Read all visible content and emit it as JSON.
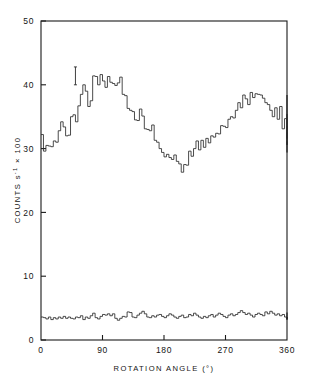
{
  "chart_data": {
    "type": "line",
    "subtype": "step-histogram",
    "title": "",
    "xlabel": "ROTATION ANGLE (°)",
    "ylabel": "COUNTS s⁻¹ × 100",
    "ylabel_parts": {
      "main": "COUNTS s",
      "exponent": "-1",
      "tail": " × 100"
    },
    "xlim": [
      0,
      360
    ],
    "ylim": [
      0,
      50
    ],
    "xticks": [
      0,
      90,
      180,
      270,
      360
    ],
    "xtick_labels": [
      "0",
      "90",
      "180",
      "270",
      "360"
    ],
    "yticks": [
      0,
      10,
      20,
      30,
      40,
      50
    ],
    "ytick_labels": [
      "0",
      "10",
      "20",
      "30",
      "40",
      "50"
    ],
    "grid": false,
    "legend": null,
    "frame": "box",
    "tick_direction": "in",
    "bin_width_deg": 3.6,
    "series": [
      {
        "name": "signal",
        "label": "modulated counts",
        "style": "step",
        "x_start": 0,
        "x_step": 3.6,
        "values": [
          32.2,
          29.6,
          30.5,
          30.4,
          30.3,
          31.2,
          31.0,
          32.8,
          34.2,
          33.4,
          32.0,
          32.1,
          35.0,
          35.3,
          34.2,
          36.7,
          38.5,
          40.0,
          39.0,
          36.6,
          37.5,
          41.4,
          41.3,
          40.0,
          41.6,
          40.6,
          39.6,
          41.3,
          40.4,
          40.2,
          39.9,
          40.3,
          41.2,
          38.5,
          38.3,
          36.3,
          36.0,
          35.8,
          34.5,
          34.4,
          36.2,
          35.1,
          33.1,
          33.0,
          32.8,
          33.7,
          31.3,
          31.0,
          30.0,
          29.4,
          28.7,
          29.1,
          28.6,
          28.3,
          29.0,
          28.0,
          27.6,
          26.3,
          27.5,
          27.4,
          29.6,
          28.8,
          30.0,
          31.2,
          29.8,
          31.3,
          30.2,
          31.6,
          30.9,
          32.0,
          31.8,
          32.4,
          32.3,
          33.6,
          33.5,
          33.3,
          34.6,
          35.0,
          34.8,
          36.0,
          37.2,
          36.4,
          38.4,
          37.8,
          36.9,
          38.8,
          38.0,
          38.6,
          38.5,
          38.4,
          37.9,
          37.2,
          36.9,
          36.0,
          35.0,
          36.4,
          34.6,
          36.6,
          33.1,
          34.7,
          33.2,
          35.0,
          38.4,
          34.8,
          33.4,
          32.2,
          31.6,
          33.4,
          31.7,
          30.6,
          30.9,
          31.1,
          30.6,
          33.0,
          35.4,
          33.5,
          30.1,
          29.4,
          30.0,
          32.5
        ],
        "errorbar": {
          "x": 50.4,
          "y": 41.4,
          "halfwidth": 1.4,
          "cap_halfwidth_deg": 2.2
        }
      },
      {
        "name": "background",
        "label": "background counts",
        "style": "step",
        "x_start": 0,
        "x_step": 3.6,
        "values": [
          3.6,
          3.5,
          3.3,
          3.6,
          3.2,
          3.5,
          3.3,
          3.6,
          3.4,
          3.7,
          3.4,
          3.6,
          3.4,
          3.3,
          3.6,
          3.5,
          3.8,
          3.2,
          3.6,
          3.4,
          3.8,
          4.2,
          3.5,
          3.3,
          3.7,
          4.0,
          3.9,
          4.1,
          3.8,
          4.1,
          3.4,
          3.1,
          3.4,
          3.7,
          3.6,
          4.4,
          4.3,
          3.6,
          3.5,
          3.9,
          4.2,
          4.5,
          4.1,
          3.6,
          3.5,
          3.8,
          3.6,
          3.9,
          4.0,
          3.7,
          3.5,
          3.8,
          4.1,
          3.9,
          3.6,
          3.4,
          3.7,
          3.9,
          3.5,
          3.6,
          4.0,
          3.8,
          4.2,
          3.9,
          3.6,
          3.4,
          3.7,
          3.5,
          3.8,
          4.0,
          3.6,
          3.9,
          4.2,
          4.0,
          3.7,
          3.5,
          3.9,
          4.1,
          3.8,
          4.0,
          4.3,
          4.6,
          4.3,
          4.0,
          4.2,
          3.9,
          3.6,
          4.0,
          4.2,
          4.0,
          3.8,
          4.4,
          4.1,
          4.5,
          4.2,
          3.9,
          4.1,
          3.8,
          4.0,
          3.6,
          3.4,
          4.0,
          4.3,
          3.7,
          3.5,
          3.3,
          3.6,
          3.4,
          3.2,
          3.5,
          3.3,
          3.6,
          3.4,
          3.2,
          3.5,
          3.3,
          3.6,
          3.4,
          3.3,
          3.5
        ]
      }
    ]
  }
}
